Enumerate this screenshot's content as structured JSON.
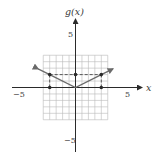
{
  "chart_data": {
    "type": "line",
    "title": "",
    "xlabel": "x",
    "ylabel": "g(x)",
    "xlim": [
      -5,
      5
    ],
    "ylim": [
      -5,
      5
    ],
    "grid": true,
    "x_ticks_labeled": [
      "-5",
      "5"
    ],
    "y_ticks_labeled": [
      "5",
      "-5"
    ],
    "series": [
      {
        "name": "g(x)",
        "style": "solid",
        "arrows_both_ends": true,
        "x": [
          -5.8,
          -4,
          0,
          4,
          5.8
        ],
        "y": [
          2.9,
          2,
          0,
          2,
          2.9
        ]
      }
    ],
    "marked_points": [
      {
        "x": -4,
        "y": 2
      },
      {
        "x": 0,
        "y": 2
      },
      {
        "x": 4,
        "y": 2
      },
      {
        "x": -4,
        "y": 0
      },
      {
        "x": 4,
        "y": 0
      }
    ],
    "dashed_lines": [
      {
        "from": [
          -4,
          2
        ],
        "to": [
          4,
          2
        ]
      },
      {
        "from": [
          -4,
          0
        ],
        "to": [
          -4,
          2
        ]
      },
      {
        "from": [
          4,
          0
        ],
        "to": [
          4,
          2
        ]
      }
    ],
    "colors": {
      "grid": "#b8b8b8",
      "axis": "#2a2a2a",
      "curve": "#6a6a6a",
      "dashed": "#4a4a4a"
    }
  },
  "labels": {
    "y_axis": "g(x)",
    "x_axis": "x",
    "x_min": "−5",
    "x_max": "5",
    "y_max": "5",
    "y_min": "−5"
  }
}
